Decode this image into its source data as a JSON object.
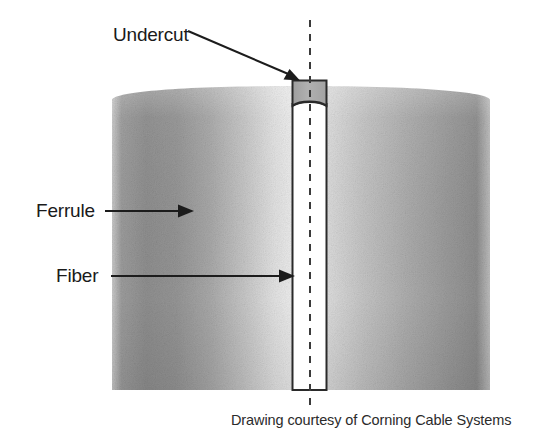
{
  "figure": {
    "caption": "Drawing courtesy of Corning Cable Systems",
    "background_color": "#ffffff"
  },
  "labels": [
    {
      "id": "undercut",
      "text": "Undercut",
      "arrow_style": "diagonal",
      "text_x": 113,
      "text_y": 41,
      "line_from_x": 188,
      "line_from_y": 31,
      "line_to_x": 298,
      "line_to_y": 79
    },
    {
      "id": "ferrule",
      "text": "Ferrule",
      "arrow_style": "horizontal",
      "text_x": 36,
      "text_y": 217,
      "line_from_x": 105,
      "line_from_y": 211,
      "line_to_x": 193,
      "line_to_y": 211
    },
    {
      "id": "fiber",
      "text": "Fiber",
      "arrow_style": "horizontal",
      "text_x": 56,
      "text_y": 282,
      "line_from_x": 111,
      "line_from_y": 276,
      "line_to_x": 294,
      "line_to_y": 276
    }
  ],
  "geometry": {
    "ferrule_left": 112,
    "ferrule_right": 490,
    "ferrule_bottom": 390,
    "ferrule_top_edge": 100,
    "ferrule_top_apex": 86,
    "channel_left": 292,
    "channel_right": 327,
    "channel_top": 105,
    "channel_bottom": 390,
    "undercut_top": 80,
    "undercut_bottom": 105,
    "centerline_x": 310,
    "centerline_top": 20,
    "centerline_bottom": 412
  },
  "colors": {
    "outline": "#2a2a2a",
    "centerline": "#3a3a3a",
    "arrow": "#1c1c1c",
    "label_text": "#1a1a1a",
    "caption_text": "#2b2b2b",
    "undercut_fill": "#a8a8a8",
    "channel_fill": "#ffffff",
    "ferrule_dark": "#8d8d8d",
    "ferrule_mid": "#a5a5a5",
    "ferrule_light": "#e6e6e6",
    "ferrule_highlight": "#f2f2f2",
    "ferrule_right_dark": "#909090"
  },
  "caption": {
    "text": "Drawing courtesy of Corning Cable Systems",
    "x": 231,
    "y": 425
  }
}
